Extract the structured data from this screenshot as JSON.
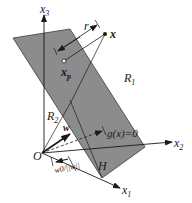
{
  "diagram": {
    "axes": {
      "x1": {
        "label": "x",
        "sub": "1"
      },
      "x2": {
        "label": "x",
        "sub": "2"
      },
      "x3": {
        "label": "x",
        "sub": "3"
      }
    },
    "origin_label": "O",
    "point_x_label": "x",
    "point_xp": {
      "label": "x",
      "sub": "p"
    },
    "distance_label": "r",
    "regions": {
      "r1": {
        "label": "R",
        "sub": "1"
      },
      "r2": {
        "label": "R",
        "sub": "2"
      }
    },
    "weight_vector_label": "w",
    "hyperplane_equation": "g(x)=0",
    "hyperplane_label": "H",
    "offset_label": "w0/||w||",
    "colors": {
      "plane_fill": "#8c8c8c",
      "plane_stroke": "#3a3a3a",
      "line": "#1a1a1a",
      "background": "#ffffff"
    }
  }
}
